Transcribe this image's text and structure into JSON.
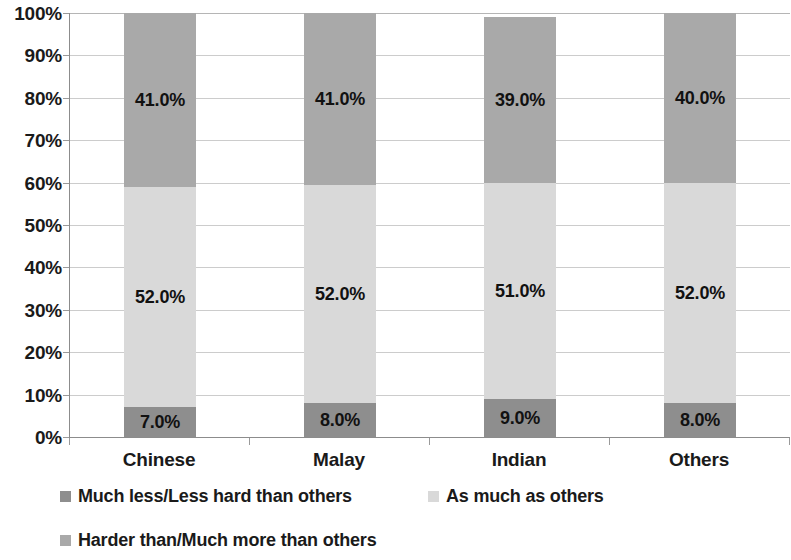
{
  "chart_data": {
    "type": "bar",
    "subtype": "stacked-100-percent",
    "title": "",
    "xlabel": "",
    "ylabel": "",
    "categories": [
      "Chinese",
      "Malay",
      "Indian",
      "Others"
    ],
    "series": [
      {
        "name": "Much less/Less hard than others",
        "color": "#8e8e8e",
        "values": [
          7.0,
          8.0,
          9.0,
          8.0
        ],
        "labels": [
          "7.0%",
          "8.0%",
          "9.0%",
          "8.0%"
        ]
      },
      {
        "name": "As much as others",
        "color": "#d9d9d9",
        "values": [
          52.0,
          52.0,
          51.0,
          52.0
        ],
        "labels": [
          "52.0%",
          "52.0%",
          "51.0%",
          "52.0%"
        ]
      },
      {
        "name": "Harder than/Much more than others",
        "color": "#a9a9a9",
        "values": [
          41.0,
          41.0,
          39.0,
          40.0
        ],
        "labels": [
          "41.0%",
          "41.0%",
          "39.0%",
          "40.0%"
        ]
      }
    ],
    "ylim": [
      0,
      100
    ],
    "y_tick_labels": [
      "0%",
      "10%",
      "20%",
      "30%",
      "40%",
      "50%",
      "60%",
      "70%",
      "80%",
      "90%",
      "100%"
    ],
    "y_tick_values": [
      0,
      10,
      20,
      30,
      40,
      50,
      60,
      70,
      80,
      90,
      100
    ],
    "grid": true,
    "grid_axis": "y",
    "legend_position": "bottom-left",
    "legend": [
      {
        "label": "Much less/Less hard than others",
        "color": "#8e8e8e"
      },
      {
        "label": "As much as others",
        "color": "#d9d9d9"
      },
      {
        "label": "Harder than/Much more than others",
        "color": "#a9a9a9"
      }
    ]
  }
}
